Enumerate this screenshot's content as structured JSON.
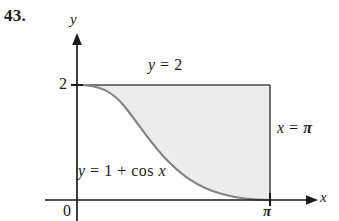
{
  "figure": {
    "exercise_number": "43.",
    "axes": {
      "y_axis_label": "y",
      "x_axis_label": "x",
      "origin_label": "0",
      "y_tick_label": "2",
      "x_tick_label": "π"
    },
    "annotations": {
      "top_line": "y = 2",
      "curve": "y = 1 + cos x",
      "right_line": "x = π"
    },
    "colors": {
      "axis": "#1a1a1a",
      "curve": "#808080",
      "boundary": "#4d4d4d",
      "shading": "#ececec",
      "background": "#ffffff"
    }
  },
  "chart_data": {
    "type": "line",
    "title": "",
    "xlabel": "x",
    "ylabel": "y",
    "xlim": [
      0,
      3.14159
    ],
    "ylim": [
      0,
      2
    ],
    "xticks": [
      0,
      3.14159
    ],
    "xticklabels": [
      "0",
      "π"
    ],
    "yticks": [
      2
    ],
    "yticklabels": [
      "2"
    ],
    "grid": false,
    "legend": "none",
    "series": [
      {
        "name": "y = 1 + cos x",
        "expression": "1 + cos(x)",
        "x": [
          0,
          0.3927,
          0.7854,
          1.1781,
          1.5708,
          1.9635,
          2.3562,
          2.7489,
          3.14159
        ],
        "values": [
          2.0,
          1.9239,
          1.7071,
          1.3827,
          1.0,
          0.6173,
          0.2929,
          0.0761,
          0.0
        ]
      },
      {
        "name": "y = 2",
        "expression": "2",
        "x": [
          0,
          3.14159
        ],
        "values": [
          2,
          2
        ]
      },
      {
        "name": "x = π",
        "expression": "x = pi",
        "x": [
          3.14159,
          3.14159
        ],
        "values": [
          0,
          2
        ]
      }
    ],
    "shaded_region": {
      "description": "Region between y = 1 + cos x and y = 2 from x = 0 to x = π",
      "upper": "y = 2",
      "lower": "y = 1 + cos x",
      "x_range": [
        0,
        3.14159
      ],
      "fill": "#ececec"
    },
    "annotations": [
      {
        "text": "y = 2",
        "x": 1.05,
        "y": 2.18
      },
      {
        "text": "y = 1 + cos x",
        "x": 0.05,
        "y": 0.62
      },
      {
        "text": "x = π",
        "x": 3.32,
        "y": 1.25
      }
    ]
  }
}
